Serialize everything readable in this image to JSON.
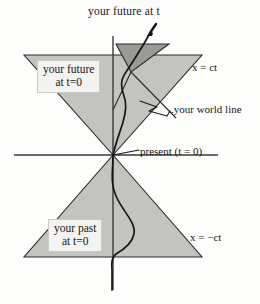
{
  "figure": {
    "kind": "spacetime-light-cone-diagram",
    "background_color": "#fdfdfc",
    "ink_color": "#17171a"
  },
  "labels": {
    "title": "your future at t",
    "future_box_line1": "your future",
    "future_box_line2": "at t=0",
    "past_box_line1": "your past",
    "past_box_line2": "at t=0",
    "x_eq_ct": "x = ct",
    "x_eq_neg_ct": "x = −ct",
    "world_line": ".your world line",
    "present": "present (t = 0)"
  },
  "geometry": {
    "origin": {
      "x": 113,
      "y": 155
    },
    "time_axis": {
      "x": 113,
      "y_top": 36,
      "y_bottom": 290
    },
    "space_axis": {
      "y": 155,
      "x_left": 14,
      "x_right": 218
    },
    "future_cone": {
      "apex": {
        "x": 113,
        "y": 155
      },
      "left_top": {
        "x": 24,
        "y": 55
      },
      "right_top": {
        "x": 202,
        "y": 55
      },
      "fill": "#c3c3c0"
    },
    "past_cone": {
      "apex": {
        "x": 113,
        "y": 155
      },
      "left_bottom": {
        "x": 24,
        "y": 257
      },
      "right_bottom": {
        "x": 202,
        "y": 257
      },
      "fill": "#c3c3c0"
    },
    "future_cone_at_t": {
      "apex": {
        "x": 131,
        "y": 72
      },
      "left_top": {
        "x": 116,
        "y": 44
      },
      "right_top": {
        "x": 169,
        "y": 44
      },
      "fill": "#9a9a97"
    },
    "world_line_arrow_tip": {
      "x": 156,
      "y": 25
    }
  },
  "colors": {
    "cone_light": "#c3c3c0",
    "cone_dark": "#9a9a97",
    "label_box_fill": "#f3f3f1",
    "label_box_border": "#c9c9c5",
    "line": "#17171a",
    "axis": "#3a3a3c"
  }
}
